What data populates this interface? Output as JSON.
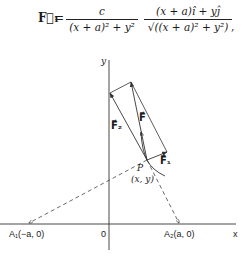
{
  "formula": {
    "lhs": "F⃗₁",
    "equals": "=",
    "fraction1": {
      "numerator": "c",
      "denominator": "(x + a)² + y²"
    },
    "fraction2": {
      "numerator": "(x + a)î + yĵ",
      "denominator": "√((x + a)² + y²)"
    },
    "trailing": ","
  },
  "diagram": {
    "axes": {
      "x_label": "x",
      "y_label": "y",
      "origin_label": "0"
    },
    "points": {
      "A1": "A₁(−a, 0)",
      "A2": "A₂(a, 0)",
      "P": "P",
      "P_coords": "(x, y)"
    },
    "vectors": {
      "F": "F⃗",
      "F1": "F⃗₁",
      "F2": "F⃗₂"
    }
  }
}
